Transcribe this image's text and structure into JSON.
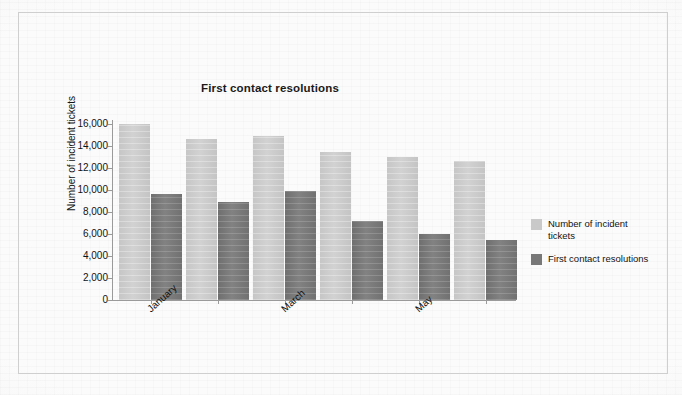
{
  "chart_data": {
    "type": "bar",
    "title": "First contact resolutions",
    "xlabel": "",
    "ylabel": "Number of incident tickets",
    "categories": [
      "January",
      "February",
      "March",
      "April",
      "May",
      "June"
    ],
    "visible_tick_labels": [
      "January",
      "March",
      "May"
    ],
    "ylim": [
      0,
      16000
    ],
    "ytick_labels": [
      "16,000",
      "14,000",
      "12,000",
      "10,000",
      "8,000",
      "6,000",
      "4,000",
      "2,000",
      "0"
    ],
    "ytick_values": [
      16000,
      14000,
      12000,
      10000,
      8000,
      6000,
      4000,
      2000,
      0
    ],
    "grid": false,
    "legend_position": "right",
    "series": [
      {
        "name": "Number of incident tickets",
        "color": "#c9c9c9",
        "values": [
          16000,
          14600,
          14900,
          13500,
          13000,
          12600
        ]
      },
      {
        "name": "First contact resolutions",
        "color": "#787878",
        "values": [
          9600,
          8900,
          9900,
          7200,
          6000,
          5500
        ]
      }
    ]
  },
  "legend": {
    "items": [
      {
        "label": "Number of incident tickets",
        "color": "#c9c9c9"
      },
      {
        "label": "First contact resolutions",
        "color": "#787878"
      }
    ]
  },
  "colors": {
    "series_light": "#c9c9c9",
    "series_dark": "#787878",
    "axis": "#9a9a9a",
    "text": "#121212",
    "frame": "#cfcfcf"
  }
}
